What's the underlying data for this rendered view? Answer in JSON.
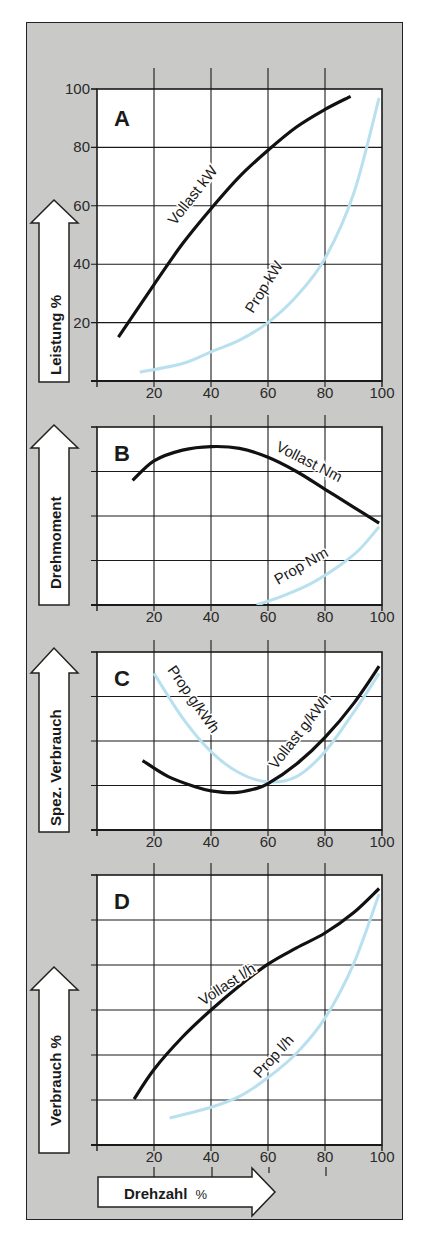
{
  "colors": {
    "panel_background": "#c9c9c7",
    "plot_background": "#ffffff",
    "grid": "#1a1a1a",
    "vollast_curve": "#111111",
    "prop_curve": "#b8e0ee"
  },
  "x_axis": {
    "label": "Drehzahl",
    "unit": "%",
    "ticks": [
      "20",
      "40",
      "60",
      "80",
      "100"
    ]
  },
  "chart_data": [
    {
      "type": "line",
      "panel": "A",
      "title": "A",
      "ylabel": "Leistung %",
      "xlabel": "Drehzahl %",
      "xlim": [
        0,
        100
      ],
      "ylim": [
        0,
        100
      ],
      "x_ticks": [
        20,
        40,
        60,
        80,
        100
      ],
      "y_ticks": [
        20,
        40,
        60,
        80,
        100
      ],
      "y_tick_labels": [
        "20",
        "40",
        "60",
        "80",
        "100"
      ],
      "grid": true,
      "series": [
        {
          "name": "Vollast kW",
          "style": "solid-black",
          "x": [
            7.5,
            20,
            30,
            40,
            50,
            60,
            70,
            80,
            89
          ],
          "y": [
            15,
            33,
            47,
            59,
            70,
            79,
            87,
            93,
            97.5
          ]
        },
        {
          "name": "Prop kW",
          "style": "light-blue",
          "x": [
            15,
            30,
            40,
            50,
            60,
            70,
            80,
            90,
            99
          ],
          "y": [
            3,
            6,
            10,
            14,
            20,
            29,
            42,
            64,
            97
          ]
        }
      ]
    },
    {
      "type": "line",
      "panel": "B",
      "title": "B",
      "ylabel": "Drehmoment",
      "xlabel": "Drehzahl %",
      "xlim": [
        0,
        100
      ],
      "ylim": [
        0,
        100
      ],
      "x_ticks": [
        20,
        40,
        60,
        80,
        100
      ],
      "y_ticks": [
        25,
        50,
        75,
        100
      ],
      "y_tick_labels": [],
      "grid": true,
      "series": [
        {
          "name": "Vollast Nm",
          "style": "solid-black",
          "x": [
            12.5,
            20,
            30,
            40,
            50,
            60,
            70,
            80,
            90,
            99
          ],
          "y": [
            70,
            81,
            87,
            89,
            88,
            83,
            75,
            65,
            55,
            46
          ]
        },
        {
          "name": "Prop Nm",
          "style": "light-blue",
          "x": [
            56,
            65,
            75,
            85,
            92,
            99
          ],
          "y": [
            0,
            5,
            12,
            22,
            31,
            44
          ]
        }
      ]
    },
    {
      "type": "line",
      "panel": "C",
      "title": "C",
      "ylabel": "Spez. Verbrauch",
      "xlabel": "Drehzahl %",
      "xlim": [
        0,
        100
      ],
      "ylim": [
        0,
        100
      ],
      "x_ticks": [
        20,
        40,
        60,
        80,
        100
      ],
      "y_ticks": [
        25,
        50,
        75,
        100
      ],
      "y_tick_labels": [],
      "grid": true,
      "series": [
        {
          "name": "Vollast g/kWh",
          "style": "solid-black",
          "x": [
            16,
            25,
            35,
            40,
            48,
            55,
            60,
            70,
            80,
            90,
            99
          ],
          "y": [
            39,
            30,
            24,
            22,
            21,
            23,
            26,
            37,
            52,
            71,
            92
          ]
        },
        {
          "name": "Prop g/kWh",
          "style": "light-blue",
          "x": [
            20,
            30,
            40,
            50,
            60,
            70,
            80,
            90,
            99
          ],
          "y": [
            88,
            63,
            44,
            32,
            27,
            30,
            44,
            66,
            88
          ]
        }
      ]
    },
    {
      "type": "line",
      "panel": "D",
      "title": "D",
      "ylabel": "Verbrauch %",
      "xlabel": "Drehzahl %",
      "xlim": [
        0,
        100
      ],
      "ylim": [
        0,
        100
      ],
      "x_ticks": [
        20,
        40,
        60,
        80,
        100
      ],
      "y_ticks": [
        16.67,
        33.33,
        50,
        66.67,
        83.33,
        100
      ],
      "y_tick_labels": [],
      "grid": true,
      "series": [
        {
          "name": "Vollast l/h",
          "style": "solid-black",
          "x": [
            13,
            20,
            30,
            40,
            50,
            60,
            70,
            80,
            90,
            99
          ],
          "y": [
            17,
            28,
            40,
            50,
            59,
            67,
            73,
            78.5,
            86,
            95
          ]
        },
        {
          "name": "Prop l/h",
          "style": "light-blue",
          "x": [
            25.5,
            40,
            50,
            60,
            70,
            80,
            90,
            99
          ],
          "y": [
            10,
            14,
            18,
            25,
            34,
            47,
            67,
            93
          ]
        }
      ]
    }
  ]
}
